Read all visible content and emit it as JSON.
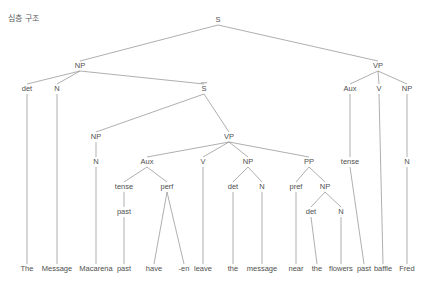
{
  "caption": "심층 구조",
  "diagram": {
    "kind": "syntax-tree",
    "line_color": "#8d8d8d",
    "text_color": "#4f4f4f",
    "sentence": "The Message Macarena past have -en leave the message near the flowers past baffle Fred",
    "nodes": [
      {
        "id": "S",
        "label": "S",
        "x": 218,
        "y": 22,
        "overbar": false
      },
      {
        "id": "NP1",
        "label": "NP",
        "x": 80,
        "y": 68,
        "overbar": false
      },
      {
        "id": "VP1",
        "label": "VP",
        "x": 378,
        "y": 68,
        "overbar": false
      },
      {
        "id": "det1",
        "label": "det",
        "x": 27,
        "y": 91,
        "overbar": false
      },
      {
        "id": "N1",
        "label": "N",
        "x": 57,
        "y": 91,
        "overbar": false
      },
      {
        "id": "Sbar",
        "label": "S",
        "x": 204,
        "y": 91,
        "overbar": true
      },
      {
        "id": "Aux1",
        "label": "Aux",
        "x": 350,
        "y": 91,
        "overbar": false
      },
      {
        "id": "V1",
        "label": "V",
        "x": 379,
        "y": 91,
        "overbar": false
      },
      {
        "id": "NP2",
        "label": "NP",
        "x": 407,
        "y": 91,
        "overbar": false
      },
      {
        "id": "NP3",
        "label": "NP",
        "x": 96,
        "y": 139,
        "overbar": false
      },
      {
        "id": "VP2",
        "label": "VP",
        "x": 229,
        "y": 139,
        "overbar": false
      },
      {
        "id": "N2",
        "label": "N",
        "x": 96,
        "y": 164,
        "overbar": false
      },
      {
        "id": "Aux2",
        "label": "Aux",
        "x": 147,
        "y": 164,
        "overbar": false
      },
      {
        "id": "V2",
        "label": "V",
        "x": 203,
        "y": 164,
        "overbar": false
      },
      {
        "id": "NP4",
        "label": "NP",
        "x": 248,
        "y": 164,
        "overbar": false
      },
      {
        "id": "PP",
        "label": "PP",
        "x": 309,
        "y": 164,
        "overbar": false
      },
      {
        "id": "tense1",
        "label": "tense",
        "x": 124,
        "y": 189,
        "overbar": false
      },
      {
        "id": "perf",
        "label": "perf",
        "x": 167,
        "y": 189,
        "overbar": false
      },
      {
        "id": "det2",
        "label": "det",
        "x": 233,
        "y": 189,
        "overbar": false
      },
      {
        "id": "N3",
        "label": "N",
        "x": 262,
        "y": 189,
        "overbar": false
      },
      {
        "id": "pref",
        "label": "pref",
        "x": 296,
        "y": 189,
        "overbar": false
      },
      {
        "id": "NP5",
        "label": "NP",
        "x": 325,
        "y": 189,
        "overbar": false
      },
      {
        "id": "tense2",
        "label": "tense",
        "x": 350,
        "y": 164,
        "overbar": false
      },
      {
        "id": "N5",
        "label": "N",
        "x": 407,
        "y": 164,
        "overbar": false
      },
      {
        "id": "past1",
        "label": "past",
        "x": 124,
        "y": 214,
        "overbar": false
      },
      {
        "id": "det3",
        "label": "det",
        "x": 311,
        "y": 214,
        "overbar": false
      },
      {
        "id": "N4",
        "label": "N",
        "x": 341,
        "y": 214,
        "overbar": false
      }
    ],
    "terminals": [
      {
        "id": "t_the1",
        "label": "The",
        "x": 27,
        "y": 271,
        "from": "det1",
        "from_y": 94
      },
      {
        "id": "t_message1",
        "label": "Message",
        "x": 57,
        "y": 271,
        "from": "N1",
        "from_y": 94
      },
      {
        "id": "t_macarena",
        "label": "Macarena",
        "x": 96,
        "y": 271,
        "from": "N2",
        "from_y": 167
      },
      {
        "id": "t_past1",
        "label": "past",
        "x": 124,
        "y": 271,
        "from": "past1",
        "from_y": 217
      },
      {
        "id": "t_have",
        "label": "have",
        "x": 154,
        "y": 271,
        "from": "perf",
        "from_y": 192
      },
      {
        "id": "t_en",
        "label": "-en",
        "x": 184,
        "y": 271,
        "from": "perf",
        "from_y": 192
      },
      {
        "id": "t_leave",
        "label": "leave",
        "x": 203,
        "y": 271,
        "from": "V2",
        "from_y": 167
      },
      {
        "id": "t_the2",
        "label": "the",
        "x": 233,
        "y": 271,
        "from": "det2",
        "from_y": 192
      },
      {
        "id": "t_message2",
        "label": "message",
        "x": 262,
        "y": 271,
        "from": "N3",
        "from_y": 192
      },
      {
        "id": "t_near",
        "label": "near",
        "x": 296,
        "y": 271,
        "from": "pref",
        "from_y": 192
      },
      {
        "id": "t_the3",
        "label": "the",
        "x": 317,
        "y": 271,
        "from": "det3",
        "from_y": 217
      },
      {
        "id": "t_flowers",
        "label": "flowers",
        "x": 341,
        "y": 271,
        "from": "N4",
        "from_y": 217
      },
      {
        "id": "t_past2",
        "label": "past",
        "x": 364,
        "y": 271,
        "from": "tense2",
        "from_y": 167
      },
      {
        "id": "t_baffle",
        "label": "baffle",
        "x": 383,
        "y": 271,
        "from": "V1",
        "from_y": 94
      },
      {
        "id": "t_fred",
        "label": "Fred",
        "x": 407,
        "y": 271,
        "from": "N5",
        "from_y": 167
      }
    ],
    "edges": [
      {
        "from": "S",
        "to": "NP1"
      },
      {
        "from": "S",
        "to": "VP1"
      },
      {
        "from": "NP1",
        "to": "det1"
      },
      {
        "from": "NP1",
        "to": "N1"
      },
      {
        "from": "NP1",
        "to": "Sbar"
      },
      {
        "from": "Sbar",
        "to": "NP3"
      },
      {
        "from": "Sbar",
        "to": "VP2"
      },
      {
        "from": "NP3",
        "to": "N2"
      },
      {
        "from": "VP2",
        "to": "Aux2"
      },
      {
        "from": "VP2",
        "to": "V2"
      },
      {
        "from": "VP2",
        "to": "NP4"
      },
      {
        "from": "VP2",
        "to": "PP"
      },
      {
        "from": "Aux2",
        "to": "tense1"
      },
      {
        "from": "Aux2",
        "to": "perf"
      },
      {
        "from": "tense1",
        "to": "past1"
      },
      {
        "from": "NP4",
        "to": "det2"
      },
      {
        "from": "NP4",
        "to": "N3"
      },
      {
        "from": "PP",
        "to": "pref"
      },
      {
        "from": "PP",
        "to": "NP5"
      },
      {
        "from": "NP5",
        "to": "det3"
      },
      {
        "from": "NP5",
        "to": "N4"
      },
      {
        "from": "VP1",
        "to": "Aux1"
      },
      {
        "from": "VP1",
        "to": "V1"
      },
      {
        "from": "VP1",
        "to": "NP2"
      },
      {
        "from": "Aux1",
        "to": "tense2"
      },
      {
        "from": "NP2",
        "to": "N5"
      }
    ]
  }
}
